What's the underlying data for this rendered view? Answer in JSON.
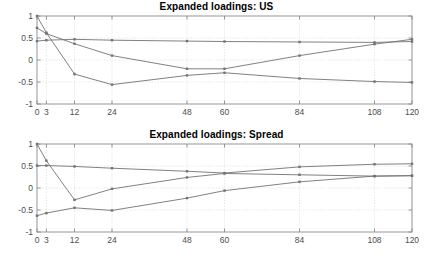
{
  "figure": {
    "width": 433,
    "height": 257,
    "background_color": "#ffffff",
    "axes_color": "#8c8c8c",
    "grid_color": "#d9d9d9",
    "line_color": "#737373",
    "tick_label_color": "#4d4d4d",
    "title_color": "#000000"
  },
  "panels": [
    {
      "id": "us",
      "title": "Expanded loadings: US"
    },
    {
      "id": "spread",
      "title": "Expanded loadings: Spread"
    }
  ],
  "chart_data": [
    {
      "type": "line",
      "title": "Expanded loadings: US",
      "xlabel": "",
      "ylabel": "",
      "x": [
        0,
        3,
        12,
        24,
        48,
        60,
        84,
        108,
        120
      ],
      "xticks": [
        0,
        3,
        12,
        24,
        48,
        60,
        84,
        108,
        120
      ],
      "xticklabels": [
        "0",
        "3",
        "12",
        "24",
        "48",
        "60",
        "84",
        "108",
        "120"
      ],
      "yticks": [
        1,
        0.5,
        0,
        -0.5,
        -1
      ],
      "yticklabels": [
        "1",
        "0.5",
        "0",
        "-0.5",
        "-1"
      ],
      "xlim": [
        0,
        120
      ],
      "ylim": [
        -1,
        1
      ],
      "grid": true,
      "legend": "none",
      "markers": "dot",
      "series": [
        {
          "name": "level",
          "values": [
            0.43,
            0.45,
            0.47,
            0.45,
            0.43,
            0.42,
            0.41,
            0.4,
            0.42
          ]
        },
        {
          "name": "slope",
          "values": [
            1.0,
            0.62,
            -0.32,
            -0.56,
            -0.35,
            -0.29,
            -0.42,
            -0.49,
            -0.51
          ]
        },
        {
          "name": "curvature",
          "values": [
            0.73,
            0.6,
            0.37,
            0.1,
            -0.2,
            -0.2,
            0.1,
            0.36,
            0.47
          ]
        }
      ]
    },
    {
      "type": "line",
      "title": "Expanded loadings: Spread",
      "xlabel": "",
      "ylabel": "",
      "x": [
        0,
        3,
        12,
        24,
        48,
        60,
        84,
        108,
        120
      ],
      "xticks": [
        0,
        3,
        12,
        24,
        48,
        60,
        84,
        108,
        120
      ],
      "xticklabels": [
        "0",
        "3",
        "12",
        "24",
        "48",
        "60",
        "84",
        "108",
        "120"
      ],
      "yticks": [
        1,
        0.5,
        0,
        -0.5,
        -1
      ],
      "yticklabels": [
        "1",
        "0.5",
        "0",
        "-0.5",
        "-1"
      ],
      "xlim": [
        0,
        120
      ],
      "ylim": [
        -1,
        1
      ],
      "grid": true,
      "legend": "none",
      "markers": "dot",
      "series": [
        {
          "name": "level",
          "values": [
            0.51,
            0.51,
            0.49,
            0.45,
            0.38,
            0.34,
            0.48,
            0.54,
            0.55
          ]
        },
        {
          "name": "slope",
          "values": [
            1.0,
            0.62,
            -0.27,
            -0.02,
            0.24,
            0.33,
            0.3,
            0.27,
            0.28
          ]
        },
        {
          "name": "curvature",
          "values": [
            -0.63,
            -0.57,
            -0.45,
            -0.51,
            -0.23,
            -0.06,
            0.14,
            0.27,
            0.28
          ]
        }
      ]
    }
  ]
}
